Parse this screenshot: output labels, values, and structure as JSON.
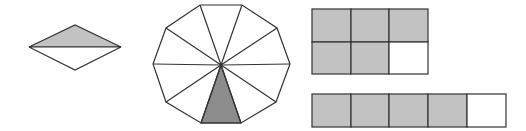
{
  "colors": {
    "stroke": "#333333",
    "light_shade": "#c2c2c2",
    "dark_shade": "#8c8c8c",
    "unshaded": "#ffffff"
  },
  "figures": [
    {
      "name": "rhombus",
      "parts_total": 2,
      "parts_shaded": 1,
      "description": "Rhombus split horizontally into two triangles; top triangle shaded"
    },
    {
      "name": "decagon",
      "parts_total": 10,
      "parts_shaded": 1,
      "description": "Regular decagon divided into 10 triangles from center; bottom triangle shaded"
    },
    {
      "name": "grid-2x3",
      "rows": 2,
      "cols": 3,
      "parts_total": 6,
      "parts_shaded": 5,
      "description": "2x3 rectangle grid with 5 shaded cells; bottom-right cell unshaded"
    },
    {
      "name": "strip-1x5",
      "rows": 1,
      "cols": 5,
      "parts_total": 5,
      "parts_shaded": 4,
      "description": "1x5 strip with first 4 cells shaded; last cell unshaded"
    }
  ]
}
